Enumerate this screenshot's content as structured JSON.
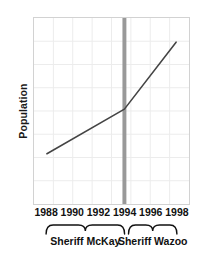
{
  "chart_data": {
    "type": "line",
    "title": "",
    "xlabel": "",
    "ylabel": "Population",
    "xlim": [
      1987,
      1999
    ],
    "ylim": [
      0,
      100
    ],
    "grid": true,
    "legend": false,
    "x_tick_labels": [
      "1988",
      "1990",
      "1992",
      "1994",
      "1996",
      "1998"
    ],
    "x_ticks": [
      1988,
      1990,
      1992,
      1994,
      1996,
      1998
    ],
    "y_tick_labels": [],
    "series": [
      {
        "name": "Population",
        "color": "#444444",
        "x": [
          1988,
          1994,
          1998
        ],
        "values": [
          27,
          51,
          87
        ]
      }
    ],
    "annotations": [
      {
        "name": "term-divider",
        "type": "vline",
        "x": 1994,
        "color": "#999999",
        "width_px": 4
      },
      {
        "name": "brace-mckay",
        "type": "brace",
        "x_start": 1988,
        "x_end": 1994,
        "label": "Sheriff McKay"
      },
      {
        "name": "brace-wazoo",
        "type": "brace",
        "x_start": 1994.3,
        "x_end": 1998,
        "label": "Sheriff Wazoo"
      }
    ]
  },
  "axes": {
    "y_title": "Population"
  },
  "xaxis": {
    "ticks": [
      {
        "label": "1988",
        "value": 1988
      },
      {
        "label": "1990",
        "value": 1990
      },
      {
        "label": "1992",
        "value": 1992
      },
      {
        "label": "1994",
        "value": 1994
      },
      {
        "label": "1996",
        "value": 1996
      },
      {
        "label": "1998",
        "value": 1998
      }
    ]
  },
  "groups": [
    {
      "label": "Sheriff McKay",
      "start": 1988,
      "end": 1994
    },
    {
      "label": "Sheriff Wazoo",
      "start": 1994.3,
      "end": 1998
    }
  ],
  "colors": {
    "line": "#444444",
    "divider": "#999999",
    "grid": "#ececec",
    "frame": "#d2d2d2",
    "text": "#111111"
  }
}
